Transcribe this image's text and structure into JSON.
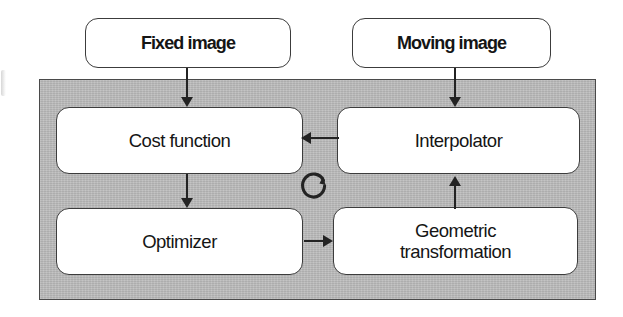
{
  "diagram": {
    "panel": {
      "name": "registration-loop-panel",
      "fill_color": "#b9b9b9",
      "border_color": "#4a4a4a"
    },
    "nodes": [
      {
        "id": "fixed-image",
        "label": "Fixed image",
        "style": "io",
        "emphasis": "bold"
      },
      {
        "id": "moving-image",
        "label": "Moving image",
        "style": "io",
        "emphasis": "bold"
      },
      {
        "id": "cost-function",
        "label": "Cost function",
        "style": "proc",
        "emphasis": "regular"
      },
      {
        "id": "interpolator",
        "label": "Interpolator",
        "style": "proc",
        "emphasis": "regular"
      },
      {
        "id": "optimizer",
        "label": "Optimizer",
        "style": "proc",
        "emphasis": "regular"
      },
      {
        "id": "geometric-transformation",
        "label": "Geometric\ntransformation",
        "style": "proc",
        "emphasis": "regular"
      }
    ],
    "edges": [
      {
        "id": "fixed-image-to-cost-function",
        "from": "fixed-image",
        "to": "cost-function",
        "direction": "down"
      },
      {
        "id": "moving-image-to-interpolator",
        "from": "moving-image",
        "to": "interpolator",
        "direction": "down"
      },
      {
        "id": "interpolator-to-cost-function",
        "from": "interpolator",
        "to": "cost-function",
        "direction": "left"
      },
      {
        "id": "cost-function-to-optimizer",
        "from": "cost-function",
        "to": "optimizer",
        "direction": "down"
      },
      {
        "id": "optimizer-to-geometric-transformation",
        "from": "optimizer",
        "to": "geometric-transformation",
        "direction": "right"
      },
      {
        "id": "geometric-transformation-to-interpolator",
        "from": "geometric-transformation",
        "to": "interpolator",
        "direction": "up"
      }
    ],
    "icons": [
      {
        "id": "iteration-loop",
        "name": "circular-loop-arrow-icon",
        "meaning": "iterative optimization loop"
      }
    ],
    "colors": {
      "node_fill": "#ffffff",
      "node_border": "#3c3c3c",
      "edge": "#232323",
      "text": "#151515",
      "background": "#ffffff"
    }
  }
}
